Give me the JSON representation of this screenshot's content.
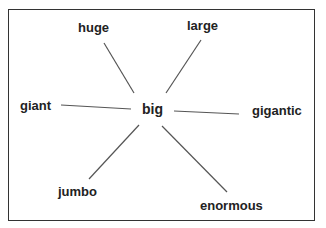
{
  "diagram": {
    "type": "word-web",
    "center": {
      "label": "big"
    },
    "spokes": [
      {
        "label": "huge"
      },
      {
        "label": "large"
      },
      {
        "label": "giant"
      },
      {
        "label": "gigantic"
      },
      {
        "label": "jumbo"
      },
      {
        "label": "enormous"
      }
    ],
    "colors": {
      "border": "#333333",
      "line": "#555555",
      "text": "#222222",
      "background": "#ffffff"
    }
  }
}
